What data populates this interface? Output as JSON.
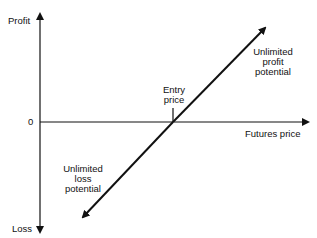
{
  "diagram": {
    "y_axis": {
      "top_label": "Profit",
      "bottom_label": "Loss",
      "zero_label": "0"
    },
    "x_axis": {
      "label": "Futures price"
    },
    "entry": {
      "label_line1": "Entry",
      "label_line2": "price"
    },
    "annotations": {
      "profit": {
        "line1": "Unlimited",
        "line2": "profit",
        "line3": "potential"
      },
      "loss": {
        "line1": "Unlimited",
        "line2": "loss",
        "line3": "potential"
      }
    },
    "colors": {
      "line": "#111111",
      "background": "#ffffff"
    }
  }
}
